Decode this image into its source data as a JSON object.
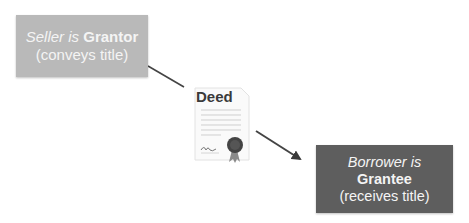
{
  "grantor_box": {
    "role_prefix": "Seller is",
    "role": "Grantor",
    "action": "(conveys title)",
    "color": "#b9b9b9"
  },
  "grantee_box": {
    "role_prefix": "Borrower is",
    "role": "Grantee",
    "action": "(receives title)",
    "color": "#5e5e5e"
  },
  "document": {
    "title": "Deed",
    "icon": "certificate-with-seal-icon"
  },
  "connectors": [
    {
      "from": "grantor_box",
      "to": "document",
      "arrowhead": false
    },
    {
      "from": "document",
      "to": "grantee_box",
      "arrowhead": true
    }
  ]
}
